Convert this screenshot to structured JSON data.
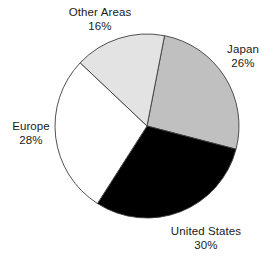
{
  "chart_data": {
    "type": "pie",
    "title": "",
    "categories": [
      "Japan",
      "United States",
      "Europe",
      "Other Areas"
    ],
    "values": [
      26,
      30,
      28,
      16
    ],
    "unit": "%",
    "legend": "none",
    "grid": false,
    "slices": [
      {
        "name": "Japan",
        "value": 26,
        "label": "Japan",
        "percent_label": "26%",
        "color": "#c0c0c0",
        "start_angle": 11.0,
        "end_angle": 104.6
      },
      {
        "name": "United States",
        "value": 30,
        "label": "United States",
        "percent_label": "30%",
        "color": "#000000",
        "start_angle": 104.6,
        "end_angle": 212.6
      },
      {
        "name": "Europe",
        "value": 28,
        "label": "Europe",
        "percent_label": "28%",
        "color": "#ffffff",
        "start_angle": 212.6,
        "end_angle": 313.4
      },
      {
        "name": "Other Areas",
        "value": 16,
        "label": "Other Areas",
        "percent_label": "16%",
        "color": "#e3e3e3",
        "start_angle": 313.4,
        "end_angle": 371.0
      }
    ],
    "geometry": {
      "center_x": 147,
      "center_y": 126,
      "radius": 92
    },
    "outline_color": "#3d3d3d",
    "background": "#ffffff"
  },
  "labels": {
    "other_areas": {
      "name": "Other Areas",
      "percent": "16%"
    },
    "japan": {
      "name": "Japan",
      "percent": "26%"
    },
    "europe": {
      "name": "Europe",
      "percent": "28%"
    },
    "united_states": {
      "name": "United States",
      "percent": "30%"
    }
  }
}
